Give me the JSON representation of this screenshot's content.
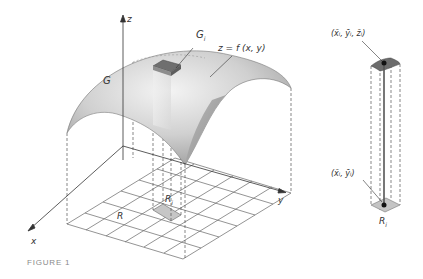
{
  "figure": {
    "caption": "FIGURE 1",
    "main_diagram": {
      "axes": {
        "z": "z",
        "x": "x",
        "y": "y"
      },
      "surface_label": "G",
      "patch_label": "G",
      "patch_label_sub": "i",
      "function_label": "z = f (x, y)",
      "region_label": "R",
      "subregion_label": "R",
      "subregion_label_sub": "i",
      "grid": {
        "rows": 6,
        "cols": 6
      }
    },
    "detail_diagram": {
      "top_point_label": "(x̄ᵢ, ȳᵢ, z̄ᵢ)",
      "base_point_label": "(x̄ᵢ, ȳᵢ)",
      "base_label": "R",
      "base_label_sub": "i"
    },
    "colors": {
      "surface_light": "#e4e4e4",
      "surface_dark": "#a9a9a9",
      "patch": "#6e6e6e",
      "subregion": "#c4c4c4",
      "lines": "#555555"
    }
  }
}
